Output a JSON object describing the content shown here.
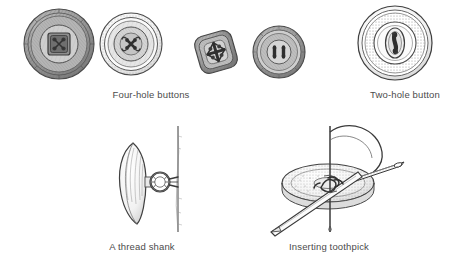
{
  "figure": {
    "background_color": "#ffffff",
    "ink_color": "#3a3a3a",
    "caption_color": "#4b4b4b"
  },
  "captions": {
    "four_hole": "Four-hole buttons",
    "two_hole": "Two-hole button",
    "thread_shank": "A thread shank",
    "inserting_toothpick": "Inserting toothpick"
  },
  "illustrations": {
    "button_round_dark": {
      "name": "four-hole button with square recessed center",
      "shape": "round",
      "holes": 4,
      "shading": "dark cross-hatch"
    },
    "button_round_ringed": {
      "name": "four-hole button with concentric rings and crossed thread",
      "shape": "round",
      "holes": 4,
      "shading": "stippled rings"
    },
    "button_square": {
      "name": "four-hole square button tilted",
      "shape": "square-diamond",
      "holes": 4,
      "shading": "medium hatch"
    },
    "button_round_small": {
      "name": "four-hole button with parallel thread bars",
      "shape": "round",
      "holes": 4,
      "shading": "hatched"
    },
    "button_two_hole": {
      "name": "two-hole button with oval recessed center",
      "shape": "round",
      "holes": 2,
      "shading": "stippled ring"
    },
    "thread_shank": {
      "name": "side view of button raised on a thread shank above fabric",
      "elements": [
        "button edge-on",
        "thread loop shank",
        "fabric line"
      ]
    },
    "inserting_toothpick": {
      "name": "toothpick laid across button while needle passes thread through holes",
      "elements": [
        "button disc",
        "toothpick",
        "needle",
        "thread loops"
      ]
    }
  }
}
